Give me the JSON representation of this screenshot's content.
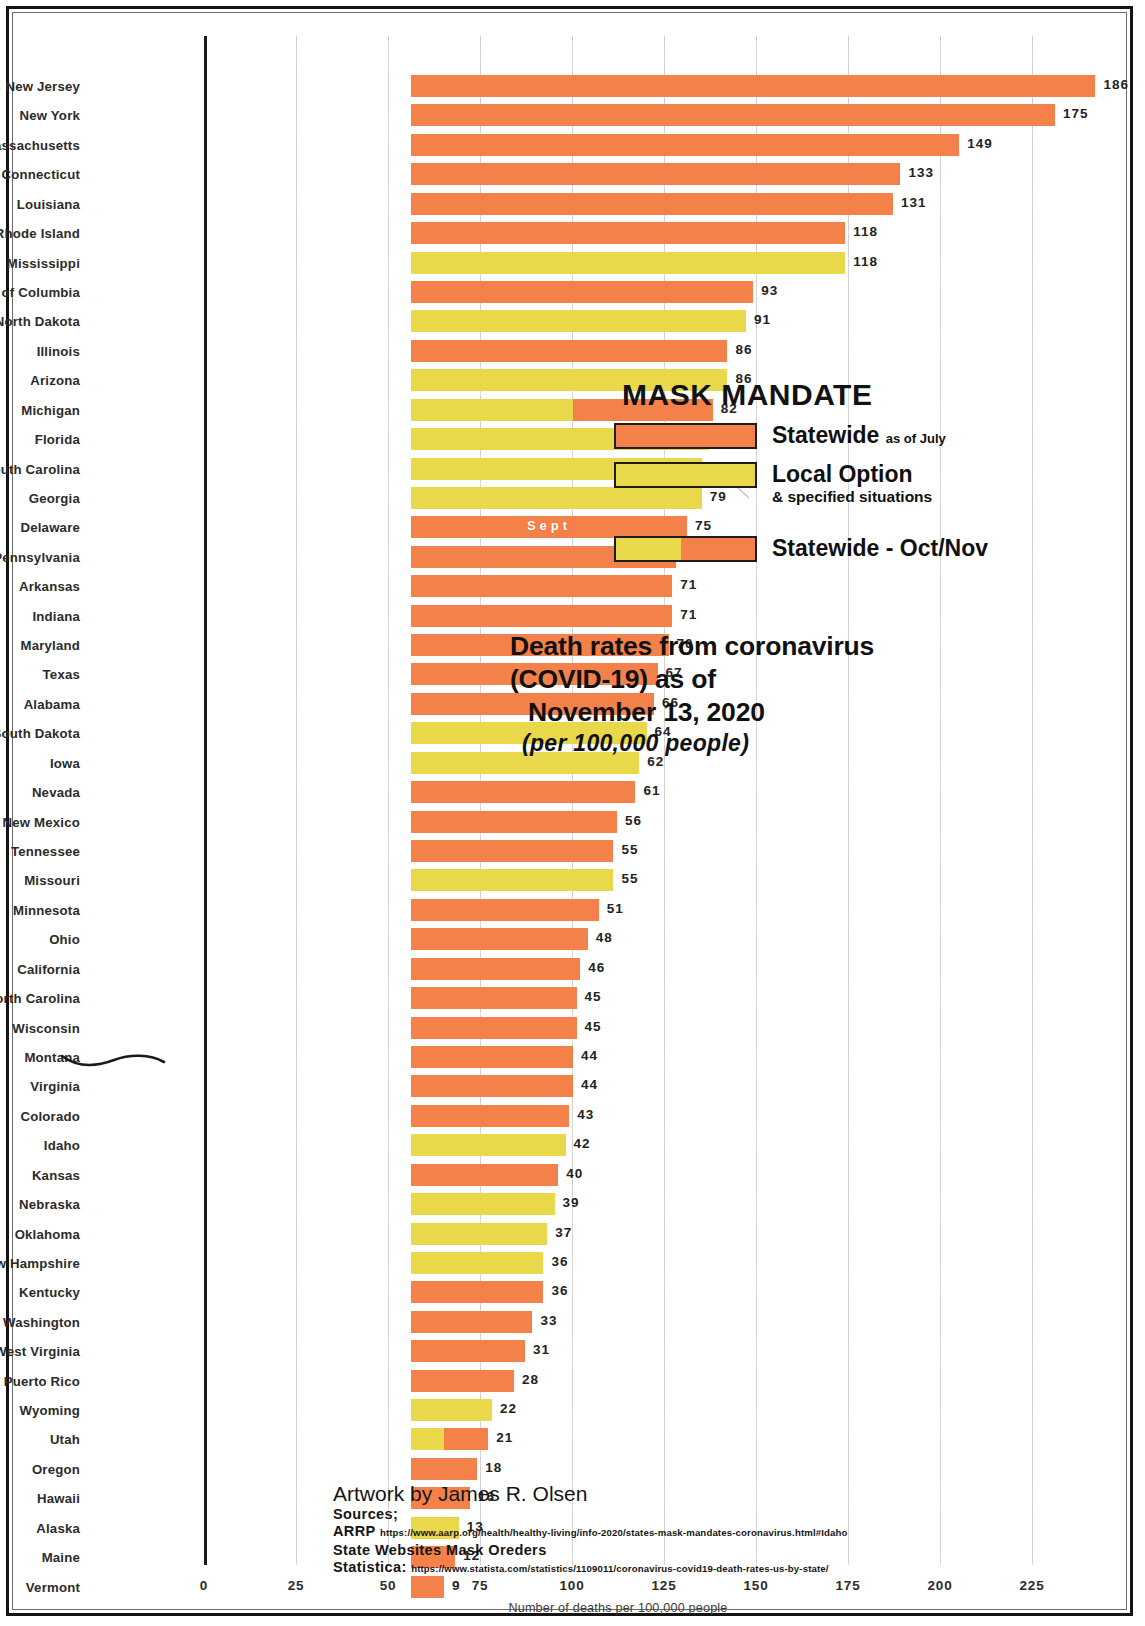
{
  "chart_data": {
    "type": "bar",
    "orientation": "horizontal",
    "title": "Death rates from coronavirus (COVID-19) as of November 13, 2020",
    "title_lines": [
      "Death rates from coronavirus",
      "(COVID-19) as of",
      "November 13, 2020"
    ],
    "subtitle": "(per 100,000 people)",
    "xlabel": "Number of deaths per 100,000 people",
    "ylabel": "",
    "xlim": [
      0,
      225
    ],
    "xticks": [
      0,
      25,
      50,
      75,
      100,
      125,
      150,
      175,
      200,
      225
    ],
    "grid": true,
    "categories": [
      "New Jersey",
      "New York",
      "Massachusetts",
      "Connecticut",
      "Louisiana",
      "Rhode Island",
      "Mississippi",
      "District of Columbia",
      "North Dakota",
      "Illinois",
      "Arizona",
      "Michigan",
      "Florida",
      "South Carolina",
      "Georgia",
      "Delaware",
      "Pennsylvania",
      "Arkansas",
      "Indiana",
      "Maryland",
      "Texas",
      "Alabama",
      "South Dakota",
      "Iowa",
      "Nevada",
      "New Mexico",
      "Tennessee",
      "Missouri",
      "Minnesota",
      "Ohio",
      "California",
      "North Carolina",
      "Wisconsin",
      "Montana",
      "Virginia",
      "Colorado",
      "Idaho",
      "Kansas",
      "Nebraska",
      "Oklahoma",
      "New Hampshire",
      "Kentucky",
      "Washington",
      "West Virginia",
      "Puerto Rico",
      "Wyoming",
      "Utah",
      "Oregon",
      "Hawaii",
      "Alaska",
      "Maine",
      "Vermont"
    ],
    "values": [
      186,
      175,
      149,
      133,
      131,
      118,
      118,
      93,
      91,
      86,
      86,
      82,
      81,
      79,
      79,
      75,
      72,
      71,
      71,
      70,
      67,
      66,
      64,
      62,
      61,
      56,
      55,
      55,
      51,
      48,
      46,
      45,
      45,
      44,
      44,
      43,
      42,
      40,
      39,
      37,
      36,
      36,
      33,
      31,
      28,
      22,
      21,
      18,
      16,
      13,
      12,
      9
    ],
    "rows": [
      {
        "state": "New Jersey",
        "value": 186,
        "category": "statewide",
        "segments": [
          {
            "type": "statewide",
            "length": 186
          }
        ]
      },
      {
        "state": "New York",
        "value": 175,
        "category": "statewide",
        "segments": [
          {
            "type": "statewide",
            "length": 175
          }
        ]
      },
      {
        "state": "Massachusetts",
        "value": 149,
        "category": "statewide",
        "segments": [
          {
            "type": "statewide",
            "length": 149
          }
        ]
      },
      {
        "state": "Connecticut",
        "value": 133,
        "category": "statewide",
        "segments": [
          {
            "type": "statewide",
            "length": 133
          }
        ]
      },
      {
        "state": "Louisiana",
        "value": 131,
        "category": "statewide",
        "segments": [
          {
            "type": "statewide",
            "length": 131
          }
        ]
      },
      {
        "state": "Rhode Island",
        "value": 118,
        "category": "statewide",
        "segments": [
          {
            "type": "statewide",
            "length": 118
          }
        ]
      },
      {
        "state": "Mississippi",
        "value": 118,
        "category": "local",
        "segments": [
          {
            "type": "local",
            "length": 118
          }
        ]
      },
      {
        "state": "District of Columbia",
        "value": 93,
        "category": "statewide",
        "segments": [
          {
            "type": "statewide",
            "length": 93
          }
        ]
      },
      {
        "state": "North Dakota",
        "value": 91,
        "category": "local",
        "segments": [
          {
            "type": "local",
            "length": 91
          }
        ]
      },
      {
        "state": "Illinois",
        "value": 86,
        "category": "statewide",
        "segments": [
          {
            "type": "statewide",
            "length": 86
          }
        ]
      },
      {
        "state": "Arizona",
        "value": 86,
        "category": "local",
        "segments": [
          {
            "type": "local",
            "length": 86
          }
        ]
      },
      {
        "state": "Michigan",
        "value": 82,
        "category": "statewide-oct-nov",
        "segments": [
          {
            "type": "local",
            "length": 44
          },
          {
            "type": "statewide",
            "length": 38
          }
        ]
      },
      {
        "state": "Florida",
        "value": 81,
        "category": "local",
        "segments": [
          {
            "type": "local",
            "length": 81
          }
        ]
      },
      {
        "state": "South Carolina",
        "value": 79,
        "category": "local",
        "segments": [
          {
            "type": "local",
            "length": 79
          }
        ]
      },
      {
        "state": "Georgia",
        "value": 79,
        "category": "local",
        "segments": [
          {
            "type": "local",
            "length": 79
          }
        ]
      },
      {
        "state": "Delaware",
        "value": 75,
        "category": "statewide",
        "segments": [
          {
            "type": "statewide",
            "length": 75
          }
        ],
        "note": "Sept"
      },
      {
        "state": "Pennsylvania",
        "value": 72,
        "category": "statewide",
        "segments": [
          {
            "type": "statewide",
            "length": 72
          }
        ]
      },
      {
        "state": "Arkansas",
        "value": 71,
        "category": "statewide",
        "segments": [
          {
            "type": "statewide",
            "length": 71
          }
        ]
      },
      {
        "state": "Indiana",
        "value": 71,
        "category": "statewide",
        "segments": [
          {
            "type": "statewide",
            "length": 71
          }
        ]
      },
      {
        "state": "Maryland",
        "value": 70,
        "category": "statewide",
        "segments": [
          {
            "type": "statewide",
            "length": 70
          }
        ]
      },
      {
        "state": "Texas",
        "value": 67,
        "category": "statewide",
        "segments": [
          {
            "type": "statewide",
            "length": 67
          }
        ]
      },
      {
        "state": "Alabama",
        "value": 66,
        "category": "statewide",
        "segments": [
          {
            "type": "statewide",
            "length": 66
          }
        ]
      },
      {
        "state": "South Dakota",
        "value": 64,
        "category": "local",
        "segments": [
          {
            "type": "local",
            "length": 64
          }
        ]
      },
      {
        "state": "Iowa",
        "value": 62,
        "category": "local",
        "segments": [
          {
            "type": "local",
            "length": 62
          }
        ]
      },
      {
        "state": "Nevada",
        "value": 61,
        "category": "statewide",
        "segments": [
          {
            "type": "statewide",
            "length": 61
          }
        ]
      },
      {
        "state": "New Mexico",
        "value": 56,
        "category": "statewide",
        "segments": [
          {
            "type": "statewide",
            "length": 56
          }
        ]
      },
      {
        "state": "Tennessee",
        "value": 55,
        "category": "statewide",
        "segments": [
          {
            "type": "statewide",
            "length": 55
          }
        ]
      },
      {
        "state": "Missouri",
        "value": 55,
        "category": "local",
        "segments": [
          {
            "type": "local",
            "length": 55
          }
        ]
      },
      {
        "state": "Minnesota",
        "value": 51,
        "category": "statewide",
        "segments": [
          {
            "type": "statewide",
            "length": 51
          }
        ]
      },
      {
        "state": "Ohio",
        "value": 48,
        "category": "statewide",
        "segments": [
          {
            "type": "statewide",
            "length": 48
          }
        ]
      },
      {
        "state": "California",
        "value": 46,
        "category": "statewide",
        "segments": [
          {
            "type": "statewide",
            "length": 46
          }
        ]
      },
      {
        "state": "North Carolina",
        "value": 45,
        "category": "statewide",
        "segments": [
          {
            "type": "statewide",
            "length": 45
          }
        ]
      },
      {
        "state": "Wisconsin",
        "value": 45,
        "category": "statewide",
        "segments": [
          {
            "type": "statewide",
            "length": 45
          }
        ]
      },
      {
        "state": "Montana",
        "value": 44,
        "category": "statewide",
        "segments": [
          {
            "type": "statewide",
            "length": 44
          }
        ]
      },
      {
        "state": "Virginia",
        "value": 44,
        "category": "statewide",
        "segments": [
          {
            "type": "statewide",
            "length": 44
          }
        ]
      },
      {
        "state": "Colorado",
        "value": 43,
        "category": "statewide",
        "segments": [
          {
            "type": "statewide",
            "length": 43
          }
        ]
      },
      {
        "state": "Idaho",
        "value": 42,
        "category": "local",
        "segments": [
          {
            "type": "local",
            "length": 42
          }
        ]
      },
      {
        "state": "Kansas",
        "value": 40,
        "category": "statewide",
        "segments": [
          {
            "type": "statewide",
            "length": 40
          }
        ]
      },
      {
        "state": "Nebraska",
        "value": 39,
        "category": "local",
        "segments": [
          {
            "type": "local",
            "length": 39
          }
        ]
      },
      {
        "state": "Oklahoma",
        "value": 37,
        "category": "local",
        "segments": [
          {
            "type": "local",
            "length": 37
          }
        ]
      },
      {
        "state": "New Hampshire",
        "value": 36,
        "category": "local",
        "segments": [
          {
            "type": "local",
            "length": 36
          }
        ]
      },
      {
        "state": "Kentucky",
        "value": 36,
        "category": "statewide",
        "segments": [
          {
            "type": "statewide",
            "length": 36
          }
        ]
      },
      {
        "state": "Washington",
        "value": 33,
        "category": "statewide",
        "segments": [
          {
            "type": "statewide",
            "length": 33
          }
        ]
      },
      {
        "state": "West Virginia",
        "value": 31,
        "category": "statewide",
        "segments": [
          {
            "type": "statewide",
            "length": 31
          }
        ]
      },
      {
        "state": "Puerto Rico",
        "value": 28,
        "category": "statewide",
        "segments": [
          {
            "type": "statewide",
            "length": 28
          }
        ]
      },
      {
        "state": "Wyoming",
        "value": 22,
        "category": "local",
        "segments": [
          {
            "type": "local",
            "length": 22
          }
        ]
      },
      {
        "state": "Utah",
        "value": 21,
        "category": "statewide-oct-nov",
        "segments": [
          {
            "type": "local",
            "length": 9
          },
          {
            "type": "statewide",
            "length": 12
          }
        ]
      },
      {
        "state": "Oregon",
        "value": 18,
        "category": "statewide",
        "segments": [
          {
            "type": "statewide",
            "length": 18
          }
        ]
      },
      {
        "state": "Hawaii",
        "value": 16,
        "category": "statewide",
        "segments": [
          {
            "type": "statewide",
            "length": 16
          }
        ]
      },
      {
        "state": "Alaska",
        "value": 13,
        "category": "local",
        "segments": [
          {
            "type": "local",
            "length": 13
          }
        ]
      },
      {
        "state": "Maine",
        "value": 12,
        "category": "statewide",
        "segments": [
          {
            "type": "statewide",
            "length": 12
          }
        ]
      },
      {
        "state": "Vermont",
        "value": 9,
        "category": "statewide",
        "segments": [
          {
            "type": "statewide",
            "length": 9
          }
        ]
      }
    ],
    "legend": {
      "position": "inside-right",
      "title": "MASK MANDATE",
      "entries": [
        {
          "label": "Statewide",
          "qualifier": "as of July",
          "sub": "",
          "swatch": "statewide"
        },
        {
          "label": "Local Option",
          "qualifier": "",
          "sub": "& specified situations",
          "swatch": "local"
        },
        {
          "label": "Statewide - Oct/Nov",
          "qualifier": "",
          "sub": "",
          "swatch": "split"
        }
      ]
    },
    "colors": {
      "statewide": "#f5814a",
      "local": "#e8d84a",
      "text": "#2b2b2b",
      "grid": "#d2d2d2",
      "axis": "#1b1b1b"
    },
    "annotations": [
      {
        "text": "Sept",
        "on": "Delaware",
        "color": "#ffffff"
      }
    ]
  },
  "credits": {
    "artwork": "Artwork by James R. Olsen",
    "sources_label": "Sources;",
    "lines": [
      {
        "name": "ARRP",
        "url": "https://www.aarp.org/health/healthy-living/info-2020/states-mask-mandates-coronavirus.html#Idaho"
      },
      {
        "name": "State Websites Mask Oreders",
        "url": ""
      },
      {
        "name": "Statistica:",
        "url": "https://www.statista.com/statistics/1109011/coronavirus-covid19-death-rates-us-by-state/"
      }
    ]
  }
}
